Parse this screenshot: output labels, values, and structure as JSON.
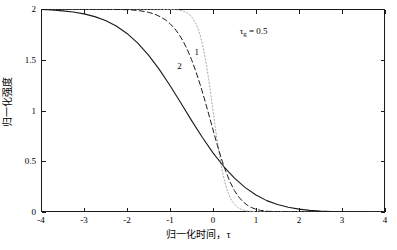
{
  "figure": {
    "background_color": "#ffffff",
    "frame_color": "#1a1a1a"
  },
  "chart_data": {
    "type": "line",
    "title": "",
    "xlabel": "归一化时间，τ",
    "ylabel": "归一化强度",
    "xlim": [
      -4,
      4
    ],
    "ylim": [
      0,
      2
    ],
    "grid": false,
    "legend": "none",
    "x_ticks": [
      "-4",
      "-3",
      "-2",
      "-1",
      "0",
      "1",
      "2",
      "3",
      "4"
    ],
    "x_tick_values": [
      -4,
      -3,
      -2,
      -1,
      0,
      1,
      2,
      3,
      4
    ],
    "y_ticks": [
      "0",
      "0.5",
      "1",
      "1.5",
      "2"
    ],
    "y_tick_values": [
      0,
      0.5,
      1,
      1.5,
      2
    ],
    "annotations": [
      {
        "text": "τ",
        "sub": "g",
        "text2": " = 0.5",
        "x": 0.62,
        "y": 1.83
      },
      {
        "text": "1",
        "x": -0.43,
        "y": 1.62
      },
      {
        "text": "2",
        "x": -0.83,
        "y": 1.48
      }
    ],
    "series": [
      {
        "name": "τg = 0.5",
        "style": "dotted",
        "color": "#aaaaaa",
        "width": 1.0,
        "x": [
          -4.0,
          -3.75,
          -3.5,
          -3.25,
          -3.0,
          -2.75,
          -2.5,
          -2.25,
          -2.0,
          -1.75,
          -1.5,
          -1.25,
          -1.0,
          -0.9,
          -0.8,
          -0.7,
          -0.6,
          -0.5,
          -0.45,
          -0.4,
          -0.35,
          -0.3,
          -0.25,
          -0.2,
          -0.15,
          -0.1,
          -0.05,
          0.0,
          0.05,
          0.1,
          0.15,
          0.2,
          0.25,
          0.3,
          0.35,
          0.4,
          0.45,
          0.5,
          0.6,
          0.7,
          0.8,
          0.9,
          1.0,
          1.25,
          1.5,
          1.75,
          2.0,
          2.5,
          3.0,
          3.5,
          4.0
        ],
        "y": [
          2.0,
          2.0,
          2.0,
          2.0,
          2.0,
          2.0,
          2.0,
          2.0,
          2.0,
          2.0,
          2.0,
          1.999,
          1.997,
          1.994,
          1.99,
          1.981,
          1.962,
          1.925,
          1.896,
          1.858,
          1.808,
          1.744,
          1.663,
          1.562,
          1.443,
          1.306,
          1.157,
          1.0,
          0.843,
          0.694,
          0.557,
          0.438,
          0.337,
          0.256,
          0.192,
          0.142,
          0.104,
          0.075,
          0.038,
          0.019,
          0.01,
          0.006,
          0.003,
          0.001,
          0.0,
          0.0,
          0.0,
          0.0,
          0.0,
          0.0,
          0.0
        ]
      },
      {
        "name": "1",
        "style": "dashed",
        "color": "#1a1a1a",
        "width": 1.0,
        "x": [
          -4.0,
          -3.75,
          -3.5,
          -3.25,
          -3.0,
          -2.75,
          -2.5,
          -2.25,
          -2.0,
          -1.9,
          -1.8,
          -1.7,
          -1.6,
          -1.5,
          -1.4,
          -1.3,
          -1.2,
          -1.1,
          -1.0,
          -0.9,
          -0.8,
          -0.7,
          -0.6,
          -0.5,
          -0.4,
          -0.3,
          -0.2,
          -0.1,
          0.0,
          0.1,
          0.2,
          0.3,
          0.4,
          0.5,
          0.6,
          0.7,
          0.8,
          0.9,
          1.0,
          1.1,
          1.2,
          1.3,
          1.4,
          1.5,
          1.75,
          2.0,
          2.25,
          2.5,
          3.0,
          3.5,
          4.0
        ],
        "y": [
          2.0,
          2.0,
          2.0,
          2.0,
          1.999,
          1.999,
          1.998,
          1.996,
          1.993,
          1.991,
          1.987,
          1.982,
          1.976,
          1.967,
          1.955,
          1.939,
          1.918,
          1.891,
          1.856,
          1.812,
          1.756,
          1.687,
          1.603,
          1.503,
          1.387,
          1.257,
          1.115,
          0.964,
          0.81,
          0.659,
          0.519,
          0.396,
          0.293,
          0.21,
          0.147,
          0.1,
          0.066,
          0.043,
          0.027,
          0.017,
          0.01,
          0.006,
          0.004,
          0.002,
          0.001,
          0.0,
          0.0,
          0.0,
          0.0,
          0.0,
          0.0
        ]
      },
      {
        "name": "2",
        "style": "solid",
        "color": "#1a1a1a",
        "width": 1.1,
        "x": [
          -4.0,
          -3.75,
          -3.5,
          -3.25,
          -3.0,
          -2.75,
          -2.5,
          -2.25,
          -2.0,
          -1.75,
          -1.5,
          -1.25,
          -1.0,
          -0.75,
          -0.5,
          -0.25,
          0.0,
          0.25,
          0.5,
          0.75,
          1.0,
          1.25,
          1.5,
          1.75,
          2.0,
          2.25,
          2.5,
          2.75,
          3.0,
          3.25,
          3.5,
          3.75,
          4.0
        ],
        "y": [
          1.995,
          1.99,
          1.982,
          1.97,
          1.952,
          1.925,
          1.886,
          1.832,
          1.759,
          1.664,
          1.546,
          1.405,
          1.246,
          1.076,
          0.903,
          0.736,
          0.583,
          0.448,
          0.333,
          0.24,
          0.167,
          0.112,
          0.073,
          0.046,
          0.028,
          0.016,
          0.009,
          0.005,
          0.003,
          0.001,
          0.001,
          0.0,
          0.0
        ]
      }
    ]
  }
}
